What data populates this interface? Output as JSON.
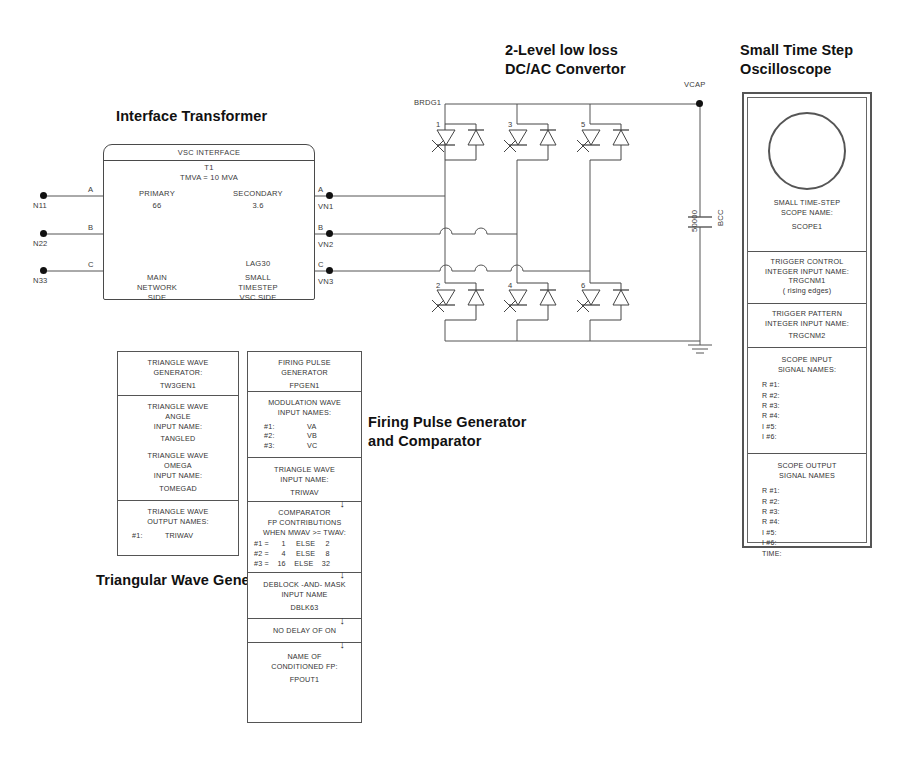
{
  "headings": {
    "interface_transformer": "Interface Transformer",
    "converter_line1": "2-Level low loss",
    "converter_line2": "DC/AC Convertor",
    "oscilloscope_line1": "Small Time Step",
    "oscilloscope_line2": "Oscilloscope",
    "fpgen_line1": "Firing Pulse Generator",
    "fpgen_line2": "and Comparator",
    "triangular": "Triangular Wave Generator"
  },
  "network_nodes": [
    {
      "name": "N11",
      "phase": "A"
    },
    {
      "name": "N22",
      "phase": "B"
    },
    {
      "name": "N33",
      "phase": "C"
    }
  ],
  "transformer": {
    "title": "VSC INTERFACE",
    "name": "T1",
    "rating": "TMVA = 10 MVA",
    "primary_label": "PRIMARY",
    "primary_kv": "66",
    "secondary_label": "SECONDARY",
    "secondary_kv": "3.6",
    "connection": "LAG30",
    "primary_side_l1": "MAIN",
    "primary_side_l2": "NETWORK",
    "primary_side_l3": "SIDE",
    "secondary_side_l1": "SMALL",
    "secondary_side_l2": "TIMESTEP",
    "secondary_side_l3": "VSC SIDE",
    "out_phases": [
      "A",
      "B",
      "C"
    ]
  },
  "vsc_nodes": [
    "VN1",
    "VN2",
    "VN3"
  ],
  "converter": {
    "bridge_label": "BRDG1",
    "upper_valves": [
      "1",
      "3",
      "5"
    ],
    "lower_valves": [
      "2",
      "4",
      "6"
    ],
    "dc_node": "VCAP",
    "cap_value": "50000",
    "cap_name": "BCC"
  },
  "oscilloscope": {
    "name_l1": "SMALL TIME-STEP",
    "name_l2": "SCOPE  NAME:",
    "name_value": "SCOPE1",
    "trigger_control_l1": "TRIGGER CONTROL",
    "trigger_control_l2": "INTEGER INPUT NAME:",
    "trigger_control_value": "TRGCNM1",
    "trigger_control_note": "( rising edges)",
    "trigger_pattern_l1": "TRIGGER PATTERN",
    "trigger_pattern_l2": "INTEGER INPUT NAME:",
    "trigger_pattern_value": "TRGCNM2",
    "input_l1": "SCOPE INPUT",
    "input_l2": "SIGNAL NAMES:",
    "input_signals": [
      "R #1:",
      "R #2:",
      "R #3:",
      "R #4:",
      "I  #5:",
      "I  #6:"
    ],
    "output_l1": "SCOPE OUTPUT",
    "output_l2": "SIGNAL NAMES",
    "output_signals": [
      "R #1:",
      "R #2:",
      "R #3:",
      "R #4:",
      "I  #5:",
      "I  #6:",
      "TIME:"
    ]
  },
  "twgen": {
    "title_l1": "TRIANGLE WAVE",
    "title_l2": "GENERATOR:",
    "title_value": "TW3GEN1",
    "angle_l1": "TRIANGLE WAVE",
    "angle_l2": "ANGLE",
    "angle_l3": "INPUT NAME:",
    "angle_value": "TANGLED",
    "omega_l1": "TRIANGLE WAVE",
    "omega_l2": "OMEGA",
    "omega_l3": "INPUT NAME:",
    "omega_value": "TOMEGAD",
    "out_l1": "TRIANGLE WAVE",
    "out_l2": "OUTPUT NAMES:",
    "out_index": "#1:",
    "out_value": "TRIWAV"
  },
  "fpgen": {
    "title_l1": "FIRING PULSE",
    "title_l2": "GENERATOR",
    "title_value": "FPGEN1",
    "mod_l1": "MODULATION WAVE",
    "mod_l2": "INPUT NAMES:",
    "mod_rows": [
      {
        "index": "#1:",
        "value": "VA"
      },
      {
        "index": "#2:",
        "value": "VB"
      },
      {
        "index": "#3:",
        "value": "VC"
      }
    ],
    "tri_l1": "TRIANGLE WAVE",
    "tri_l2": "INPUT NAME:",
    "tri_value": "TRIWAV",
    "comp_l1": "COMPARATOR",
    "comp_l2": "FP CONTRIBUTIONS",
    "comp_l3": "WHEN MWAV >= TWAV:",
    "comp_rows": [
      {
        "index": "#1 =",
        "on": "1",
        "else": "ELSE",
        "off": "2"
      },
      {
        "index": "#2 =",
        "on": "4",
        "else": "ELSE",
        "off": "8"
      },
      {
        "index": "#3 =",
        "on": "16",
        "else": "ELSE",
        "off": "32"
      }
    ],
    "deblock_l1": "DEBLOCK -AND- MASK",
    "deblock_l2": "INPUT NAME",
    "deblock_value": "DBLK63",
    "delay_text": "NO DELAY OF ON",
    "cond_l1": "NAME OF",
    "cond_l2": "CONDITIONED FP:",
    "cond_value": "FPOUT1"
  }
}
